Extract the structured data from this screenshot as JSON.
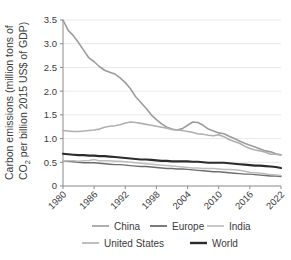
{
  "chart_data": {
    "type": "line",
    "title": "",
    "xlabel": "",
    "ylabel": "Carbon emissions (million tons of CO₂ per billion 2015 US$ of GDP)",
    "ylabel_line1": "Carbon emissions (million tons of",
    "ylabel_line2_pre": "CO",
    "ylabel_line2_sub": "2",
    "ylabel_line2_post": " per billion 2015 US$ of GDP)",
    "xlim": [
      1980,
      2022
    ],
    "ylim": [
      0,
      3.5
    ],
    "grid": "horizontal",
    "legend_position": "bottom",
    "yticks": [
      "0",
      "0.5",
      "1.0",
      "1.5",
      "2.0",
      "2.5",
      "3.0",
      "3.5"
    ],
    "ytick_values": [
      0,
      0.5,
      1.0,
      1.5,
      2.0,
      2.5,
      3.0,
      3.5
    ],
    "xticks": [
      "1980",
      "1986",
      "1992",
      "1998",
      "2004",
      "2010",
      "2016",
      "2022"
    ],
    "xtick_values": [
      1980,
      1986,
      1992,
      1998,
      2004,
      2010,
      2016,
      2022
    ],
    "x": [
      1980,
      1981,
      1982,
      1983,
      1984,
      1985,
      1986,
      1987,
      1988,
      1989,
      1990,
      1991,
      1992,
      1993,
      1994,
      1995,
      1996,
      1997,
      1998,
      1999,
      2000,
      2001,
      2002,
      2003,
      2004,
      2005,
      2006,
      2007,
      2008,
      2009,
      2010,
      2011,
      2012,
      2013,
      2014,
      2015,
      2016,
      2017,
      2018,
      2019,
      2020,
      2021,
      2022
    ],
    "series": [
      {
        "name": "China",
        "color": "#9c9c9c",
        "width": 1.6,
        "values": [
          3.5,
          3.28,
          3.17,
          3.02,
          2.86,
          2.7,
          2.62,
          2.52,
          2.44,
          2.4,
          2.36,
          2.28,
          2.18,
          2.05,
          1.88,
          1.76,
          1.64,
          1.5,
          1.4,
          1.31,
          1.24,
          1.2,
          1.18,
          1.21,
          1.28,
          1.35,
          1.34,
          1.28,
          1.2,
          1.16,
          1.12,
          1.1,
          1.05,
          1.0,
          0.95,
          0.9,
          0.86,
          0.82,
          0.78,
          0.74,
          0.72,
          0.68,
          0.66
        ]
      },
      {
        "name": "Europe",
        "color": "#6d6d6d",
        "width": 1.4,
        "values": [
          0.53,
          0.52,
          0.51,
          0.5,
          0.49,
          0.49,
          0.49,
          0.48,
          0.47,
          0.46,
          0.45,
          0.45,
          0.44,
          0.43,
          0.42,
          0.41,
          0.41,
          0.4,
          0.39,
          0.38,
          0.37,
          0.37,
          0.36,
          0.36,
          0.35,
          0.34,
          0.33,
          0.32,
          0.31,
          0.3,
          0.3,
          0.29,
          0.28,
          0.27,
          0.26,
          0.25,
          0.25,
          0.24,
          0.23,
          0.22,
          0.21,
          0.21,
          0.2
        ]
      },
      {
        "name": "India",
        "color": "#bdbdbd",
        "width": 1.5,
        "values": [
          0.53,
          0.53,
          0.53,
          0.52,
          0.53,
          0.54,
          0.56,
          0.53,
          0.53,
          0.53,
          0.52,
          0.52,
          0.51,
          0.5,
          0.49,
          0.48,
          0.47,
          0.46,
          0.45,
          0.44,
          0.43,
          0.42,
          0.41,
          0.4,
          0.39,
          0.38,
          0.38,
          0.37,
          0.37,
          0.37,
          0.36,
          0.35,
          0.35,
          0.34,
          0.33,
          0.31,
          0.29,
          0.28,
          0.27,
          0.26,
          0.24,
          0.23,
          0.22
        ]
      },
      {
        "name": "United States",
        "color": "#b0b0b0",
        "width": 1.6,
        "values": [
          1.17,
          1.16,
          1.15,
          1.15,
          1.16,
          1.17,
          1.18,
          1.2,
          1.24,
          1.26,
          1.27,
          1.29,
          1.33,
          1.35,
          1.34,
          1.32,
          1.3,
          1.28,
          1.26,
          1.24,
          1.22,
          1.19,
          1.18,
          1.17,
          1.15,
          1.13,
          1.1,
          1.09,
          1.07,
          1.06,
          1.08,
          1.04,
          0.98,
          0.94,
          0.9,
          0.84,
          0.79,
          0.76,
          0.74,
          0.71,
          0.67,
          0.67,
          0.65
        ]
      },
      {
        "name": "World",
        "color": "#2b2b2b",
        "width": 2.1,
        "values": [
          0.68,
          0.67,
          0.66,
          0.65,
          0.65,
          0.64,
          0.64,
          0.63,
          0.63,
          0.62,
          0.61,
          0.6,
          0.59,
          0.58,
          0.57,
          0.56,
          0.56,
          0.55,
          0.54,
          0.53,
          0.53,
          0.52,
          0.52,
          0.52,
          0.52,
          0.51,
          0.51,
          0.5,
          0.49,
          0.49,
          0.49,
          0.49,
          0.48,
          0.47,
          0.46,
          0.45,
          0.44,
          0.43,
          0.43,
          0.42,
          0.41,
          0.4,
          0.38
        ]
      }
    ]
  },
  "legend": {
    "items": [
      {
        "label": "China",
        "color": "#9c9c9c",
        "width": 1.6
      },
      {
        "label": "Europe",
        "color": "#6d6d6d",
        "width": 1.8
      },
      {
        "label": "India",
        "color": "#bdbdbd",
        "width": 1.6
      },
      {
        "label": "United States",
        "color": "#b0b0b0",
        "width": 1.6
      },
      {
        "label": "World",
        "color": "#2b2b2b",
        "width": 2.4
      }
    ]
  },
  "style": {
    "background": "#ffffff",
    "grid_color": "#e9e9e9",
    "axis_color": "#8a8a8a",
    "text_color": "#3b3b3b"
  }
}
